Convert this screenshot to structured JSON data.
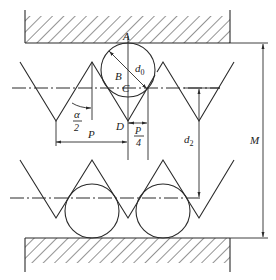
{
  "diagram": {
    "labels": {
      "A": "A",
      "B": "B",
      "C": "C",
      "D": "D",
      "d0": "d",
      "d0_sub": "0",
      "alpha_num": "α",
      "alpha_den": "2",
      "P": "P",
      "P4_num": "P",
      "P4_den": "4",
      "d2": "d",
      "d2_sub": "2",
      "M": "M"
    },
    "components": [
      "upper-anvil (hatched)",
      "lower-anvil (hatched)",
      "measuring-wire-top",
      "measuring-wire-bottom-left",
      "measuring-wire-bottom-right",
      "thread-profile-top",
      "thread-profile-bottom",
      "pitch-line-top",
      "pitch-line-bottom"
    ],
    "dimensions": [
      "d0",
      "α/2",
      "P",
      "P/4",
      "d2",
      "M"
    ],
    "colors": {
      "line": "#2a2a2a",
      "background": "#ffffff"
    }
  }
}
